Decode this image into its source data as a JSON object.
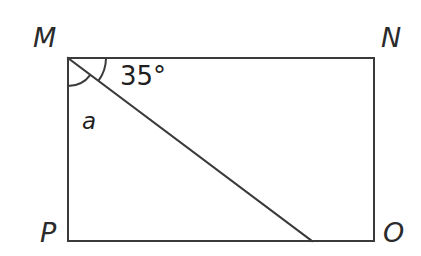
{
  "figure": {
    "kind": "geometry-diagram",
    "shape": "rectangle-with-diagonal-transversal",
    "background_color": "#ffffff",
    "stroke_color": "#3a3a3a",
    "stroke_width": 2,
    "text_color": "#2b2b2b"
  },
  "vertices": {
    "m": {
      "label": "M",
      "x": 68,
      "y": 58
    },
    "n": {
      "label": "N",
      "x": 374,
      "y": 58
    },
    "o": {
      "label": "O",
      "x": 374,
      "y": 241
    },
    "p": {
      "label": "P",
      "x": 68,
      "y": 241
    }
  },
  "transversal": {
    "from": "M",
    "start_x": 68,
    "start_y": 58,
    "end_x": 312,
    "end_y": 241
  },
  "angles": {
    "known": {
      "name": "angle-35-degrees",
      "text": "35°",
      "value": 35,
      "unit": "degrees",
      "between": "transversal and side MN",
      "arc_radius": 38
    },
    "unknown": {
      "name": "angle-a",
      "text": "a",
      "between": "side MP and transversal",
      "arc_radius": 28
    }
  },
  "sides": {
    "mn": "MN",
    "no": "NO",
    "op": "OP",
    "pm": "PM"
  }
}
